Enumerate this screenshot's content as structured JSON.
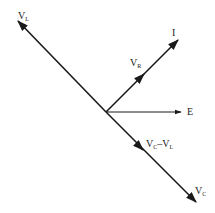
{
  "diagram": {
    "type": "phasor-diagram",
    "line_color": "#1a1a1a",
    "origin": {
      "x": 106,
      "y": 112
    },
    "vectors": [
      {
        "id": "VL",
        "label_main": "V",
        "label_sub": "L",
        "from": [
          106,
          112
        ],
        "to": [
          17,
          20
        ]
      },
      {
        "id": "VC",
        "label_main": "V",
        "label_sub": "C",
        "from": [
          106,
          112
        ],
        "to": [
          197,
          203
        ]
      },
      {
        "id": "I",
        "label_main": "I",
        "label_sub": "",
        "from": [
          106,
          112
        ],
        "to": [
          179,
          39
        ]
      },
      {
        "id": "E",
        "label_main": "E",
        "label_sub": "",
        "from": [
          106,
          112
        ],
        "to": [
          181,
          112
        ]
      }
    ],
    "midpoint_arrows": [
      {
        "on": "I",
        "at": [
          142,
          75
        ],
        "dir": "up-right"
      },
      {
        "on": "VC",
        "at": [
          142,
          149
        ],
        "dir": "down-right"
      }
    ],
    "labels": {
      "VL": {
        "main": "V",
        "sub": "L"
      },
      "I": {
        "main": "I"
      },
      "VR": {
        "main": "V",
        "sub": "R"
      },
      "E": {
        "main": "E"
      },
      "VCminusVL": {
        "main1": "V",
        "sub1": "C",
        "minus": "–",
        "main2": "V",
        "sub2": "L"
      },
      "VC": {
        "main": "V",
        "sub": "C"
      }
    }
  }
}
